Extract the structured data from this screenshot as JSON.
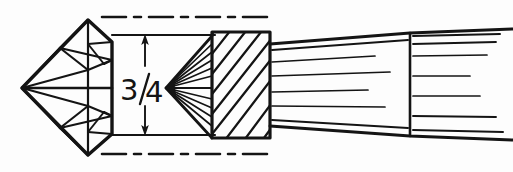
{
  "figure": {
    "background_color": "#fdfdfd",
    "ink_color": "#141414",
    "width": 513,
    "height": 172
  },
  "dimension": {
    "value_label": "3/4",
    "numerator": "3",
    "denominator": "4",
    "unit_implied": "inch",
    "arrow_x": 145,
    "upper_extension_y": 35,
    "lower_extension_y": 135,
    "text_x": 138,
    "text_y": 100
  },
  "centerlines": {
    "style": "dash-dot",
    "top_y": 17,
    "bottom_y": 154,
    "x_start": 100,
    "x_end": 275,
    "dash_pattern": "22 7 7 7"
  },
  "gemstone": {
    "name": "brilliant-cut-gem-profile",
    "left_apex": {
      "x": 22,
      "y": 88
    },
    "top_apex": {
      "x": 88,
      "y": 20
    },
    "bottom_apex": {
      "x": 88,
      "y": 155
    },
    "right_edge_x": 112,
    "girdle_y": 88,
    "facet_count": 22
  },
  "brush": {
    "name": "paintbrush",
    "bristles": {
      "tip": {
        "x": 166,
        "y": 88
      },
      "base_x": 212,
      "top_y": 36,
      "bottom_y": 138,
      "ray_count": 13
    },
    "ferrule": {
      "x": 212,
      "y": 32,
      "width": 58,
      "height": 106,
      "hatch_angle_deg": 35,
      "hatch_count": 11
    },
    "handle": {
      "x_start": 270,
      "x_end": 513,
      "near_top_y": 44,
      "near_bottom_y": 126,
      "far_top_y": 32,
      "far_bottom_y": 136,
      "joint_x": 410,
      "grain_line_count": 12
    }
  },
  "accessibility": {
    "alt_text": "Line drawing showing a faceted gemstone at left, a three-quarter inch vertical dimension with arrows, and a paintbrush with bristles, hatched ferrule and tapering handle at right."
  }
}
